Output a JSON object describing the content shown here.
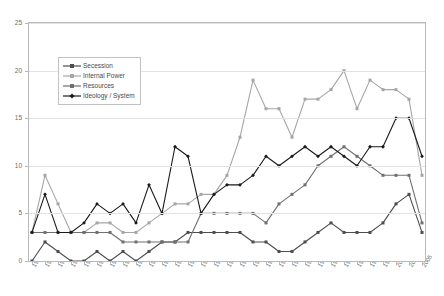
{
  "chart_data": {
    "type": "line",
    "title": "",
    "xlabel": "",
    "ylabel": "",
    "ylim": [
      0,
      25
    ],
    "ytick_step": 5,
    "yticks": [
      0,
      5,
      10,
      15,
      20,
      25
    ],
    "grid": true,
    "legend_position": "upper-left-inside",
    "x": [
      1945,
      1947,
      1949,
      1951,
      1953,
      1955,
      1957,
      1959,
      1961,
      1963,
      1965,
      1967,
      1969,
      1971,
      1973,
      1975,
      1977,
      1979,
      1981,
      1983,
      1985,
      1987,
      1989,
      1991,
      1993,
      1995,
      1997,
      1999,
      2001,
      2003,
      2005
    ],
    "categories": [
      "1945",
      "1947",
      "1949",
      "1951",
      "1953",
      "1955",
      "1957",
      "1959",
      "1961",
      "1963",
      "1965",
      "1967",
      "1969",
      "1971",
      "1973",
      "1975",
      "1977",
      "1979",
      "1981",
      "1983",
      "1985",
      "1987",
      "1989",
      "1991",
      "1993",
      "1995",
      "1997",
      "1999",
      "2001",
      "2003",
      "2005"
    ],
    "series": [
      {
        "name": "Secession",
        "color": "#4d4d4d",
        "marker": "square",
        "values": [
          0,
          2,
          1,
          0,
          0,
          1,
          0,
          1,
          0,
          1,
          2,
          2,
          3,
          3,
          3,
          3,
          3,
          2,
          2,
          1,
          1,
          2,
          3,
          4,
          3,
          3,
          3,
          4,
          6,
          7,
          3
        ]
      },
      {
        "name": "Internal Power",
        "color": "#a6a6a6",
        "marker": "square",
        "values": [
          3,
          9,
          6,
          3,
          3,
          4,
          4,
          3,
          3,
          4,
          5,
          6,
          6,
          7,
          7,
          9,
          13,
          19,
          16,
          16,
          13,
          17,
          17,
          18,
          20,
          16,
          19,
          18,
          18,
          17,
          9
        ]
      },
      {
        "name": "Resources",
        "color": "#707070",
        "marker": "square",
        "values": [
          3,
          3,
          3,
          3,
          3,
          3,
          3,
          2,
          2,
          2,
          2,
          2,
          2,
          5,
          5,
          5,
          5,
          5,
          4,
          6,
          7,
          8,
          10,
          11,
          12,
          11,
          10,
          9,
          9,
          9,
          4
        ]
      },
      {
        "name": "Ideology / System",
        "color": "#1a1a1a",
        "marker": "diamond",
        "values": [
          3,
          7,
          3,
          3,
          4,
          6,
          5,
          6,
          4,
          8,
          5,
          12,
          11,
          5,
          7,
          8,
          8,
          9,
          11,
          10,
          11,
          12,
          11,
          12,
          11,
          10,
          12,
          12,
          15,
          15,
          11
        ]
      }
    ]
  },
  "legend": {
    "items": [
      {
        "label": "Secession"
      },
      {
        "label": "Internal Power"
      },
      {
        "label": "Resources"
      },
      {
        "label": "Ideology / System"
      }
    ]
  }
}
